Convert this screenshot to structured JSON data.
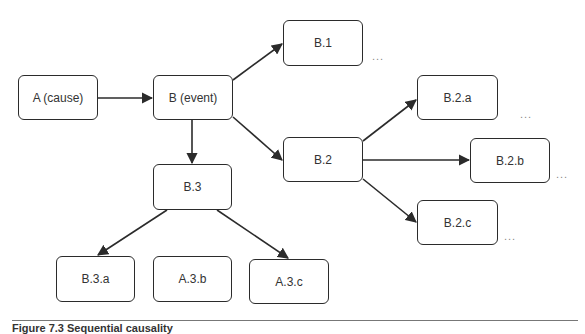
{
  "diagram": {
    "nodes": [
      {
        "id": "A",
        "label": "A (cause)",
        "x": 18,
        "y": 75,
        "w": 80,
        "h": 45
      },
      {
        "id": "B",
        "label": "B (event)",
        "x": 153,
        "y": 75,
        "w": 80,
        "h": 45
      },
      {
        "id": "B1",
        "label": "B.1",
        "x": 283,
        "y": 20,
        "w": 80,
        "h": 46
      },
      {
        "id": "B2",
        "label": "B.2",
        "x": 283,
        "y": 137,
        "w": 80,
        "h": 45
      },
      {
        "id": "B3",
        "label": "B.3",
        "x": 153,
        "y": 164,
        "w": 79,
        "h": 46
      },
      {
        "id": "B2a",
        "label": "B.2.a",
        "x": 417,
        "y": 75,
        "w": 81,
        "h": 45
      },
      {
        "id": "B2b",
        "label": "B.2.b",
        "x": 470,
        "y": 138,
        "w": 80,
        "h": 45
      },
      {
        "id": "B2c",
        "label": "B.2.c",
        "x": 417,
        "y": 200,
        "w": 81,
        "h": 45
      },
      {
        "id": "B3a",
        "label": "B.3.a",
        "x": 56,
        "y": 256,
        "w": 79,
        "h": 46
      },
      {
        "id": "A3b",
        "label": "A.3.b",
        "x": 153,
        "y": 256,
        "w": 79,
        "h": 46
      },
      {
        "id": "A3c",
        "label": "A.3.c",
        "x": 249,
        "y": 259,
        "w": 80,
        "h": 45
      }
    ],
    "edges": [
      {
        "from": "A",
        "to": "B"
      },
      {
        "from": "B",
        "to": "B1"
      },
      {
        "from": "B",
        "to": "B2"
      },
      {
        "from": "B",
        "to": "B3"
      },
      {
        "from": "B2",
        "to": "B2a"
      },
      {
        "from": "B2",
        "to": "B2b"
      },
      {
        "from": "B2",
        "to": "B2c"
      },
      {
        "from": "B3",
        "to": "B3a"
      },
      {
        "from": "B3",
        "to": "A3c"
      }
    ],
    "ellipses": [
      {
        "label": "...",
        "x": 372,
        "y": 50
      },
      {
        "label": "...",
        "x": 520,
        "y": 108
      },
      {
        "label": "...",
        "x": 556,
        "y": 168
      },
      {
        "label": "...",
        "x": 504,
        "y": 230
      }
    ]
  },
  "caption": "Figure 7.3  Sequential causality",
  "colors": {
    "stroke": "#2b2b2b",
    "text": "#333333",
    "ellipsis": "#888888"
  }
}
